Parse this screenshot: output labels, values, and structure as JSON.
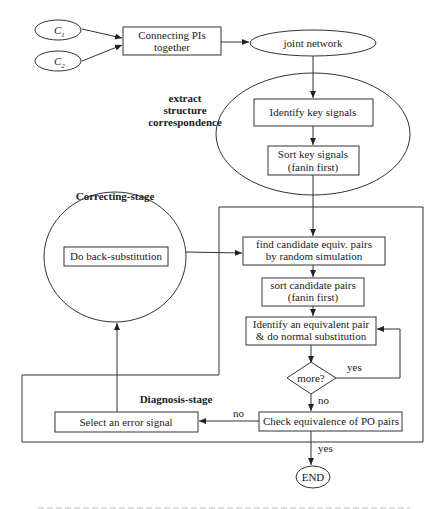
{
  "diagram": {
    "inputs": [
      {
        "label": "C",
        "sub": "1"
      },
      {
        "label": "C",
        "sub": "2"
      }
    ],
    "connect_box": [
      "Connecting PIs",
      "together"
    ],
    "joint_network": "joint network",
    "extract_label": [
      "extract",
      "structure",
      "correspondence"
    ],
    "identify_key": "Identify key signals",
    "sort_key": [
      "Sort key signals",
      "(fanin first)"
    ],
    "correcting_label": "Correcting-stage",
    "back_sub": "Do back-substitution",
    "find_candidate": [
      "find candidate equiv. pairs",
      "by random simulation"
    ],
    "sort_candidate": [
      "sort candidate pairs",
      "(fanin first)"
    ],
    "identify_pair": [
      "Identify an equivalent pair",
      "& do normal substitution"
    ],
    "decision": "more?",
    "yes1": "yes",
    "no1": "no",
    "diagnosis_label": "Diagnosis-stage",
    "check_po": "Check equivalence of PO pairs",
    "no2": "no",
    "select_error": "Select an error signal",
    "yes2": "yes",
    "end": "END"
  }
}
